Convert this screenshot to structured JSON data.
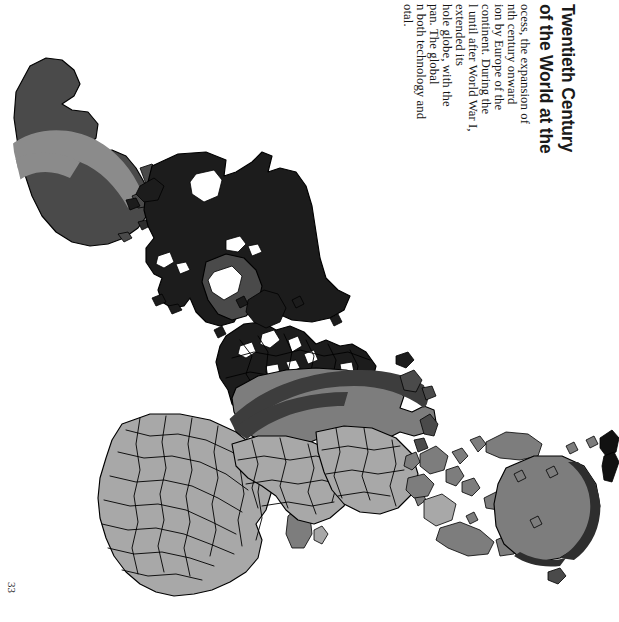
{
  "page": {
    "number": "33",
    "orientation": "rotated-90-clockwise",
    "background_color": "#ffffff"
  },
  "heading": {
    "line_1": "of the World at the",
    "line_2": "Twentieth Century",
    "full_visible_text": "of the World at the Twentieth Century",
    "style": "bold-sans-serif",
    "color": "#111111"
  },
  "body_text": {
    "lines": [
      "ocess, the expansion of",
      "nth century onward",
      "ion by Europe of the",
      "continent. During the",
      "l until after World War I,",
      "extended its",
      "hole globe, with the",
      "pan. The global",
      "n both technology and",
      "otal."
    ],
    "color": "#141414",
    "note_clipped": "left-edge-cropped"
  },
  "map": {
    "title_caption": "world map",
    "projection_note": "world map rendered sideways on the scanned page",
    "ocean_color": "#ffffff",
    "outline_color": "#000000",
    "shade_legend": [
      {
        "name": "light-gray-region",
        "color": "#a8a8a8"
      },
      {
        "name": "medium-gray-region",
        "color": "#7d7d7d"
      },
      {
        "name": "dark-gray-region",
        "color": "#4a4a4a"
      },
      {
        "name": "near-black-region",
        "color": "#1c1c1c"
      },
      {
        "name": "overlay-swoosh",
        "color": "#3d3d3d"
      }
    ],
    "landmasses": [
      {
        "name": "south-america",
        "shade": "dark-gray-region"
      },
      {
        "name": "central-america-caribbean",
        "shade": "dark-gray-region"
      },
      {
        "name": "north-america",
        "shade": "near-black-region"
      },
      {
        "name": "greenland",
        "shade": "dark-gray-region"
      },
      {
        "name": "europe",
        "shade": "near-black-region"
      },
      {
        "name": "africa",
        "shade": "light-gray-region"
      },
      {
        "name": "russia-siberia",
        "shade": "medium-gray-region"
      },
      {
        "name": "middle-east-south-asia",
        "shade": "light-gray-region"
      },
      {
        "name": "east-asia-china",
        "shade": "light-gray-region"
      },
      {
        "name": "southeast-asia-islands",
        "shade": "medium-gray-region"
      },
      {
        "name": "australia",
        "shade": "medium-gray-region"
      },
      {
        "name": "new-zealand",
        "shade": "near-black-region"
      }
    ]
  }
}
